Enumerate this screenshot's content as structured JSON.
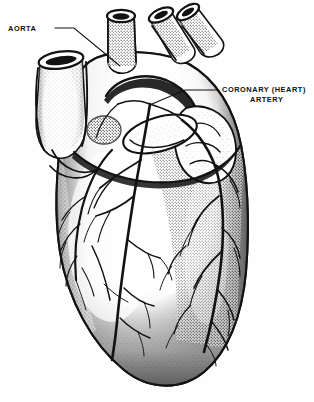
{
  "figure": {
    "style": "stippled pen-and-ink medical illustration",
    "background_color": "#fefefe",
    "ink_color": "#121212",
    "width": 314,
    "height": 402
  },
  "labels": [
    {
      "id": "aorta",
      "name": "aorta-label",
      "lines": [
        "AORTA"
      ],
      "text_x": 8,
      "text_y": 31,
      "anchor": "start",
      "leader": "M55,28 L74,28 L120,66",
      "leader_tip_x": 120,
      "leader_tip_y": 66
    },
    {
      "id": "coronary_artery",
      "name": "coronary-artery-label",
      "lines": [
        "CORONARY (HEART)",
        "ARTERY"
      ],
      "text_x": 222,
      "text_y": 92,
      "line2_x": 250,
      "line2_y": 102,
      "anchor": "start",
      "leader": "M218,90 L185,90 L152,104",
      "leader_tip_x": 152,
      "leader_tip_y": 104
    }
  ],
  "anatomy": {
    "great_vessels": [
      {
        "name": "aortic-arch-stump",
        "x": 120,
        "y": 12,
        "orientation": "vertical"
      },
      {
        "name": "pulmonary-trunk-stump",
        "x": 162,
        "y": 10,
        "orientation": "angled-right"
      },
      {
        "name": "superior-vessel-stump",
        "x": 188,
        "y": 8,
        "orientation": "angled-right"
      },
      {
        "name": "superior-vena-cava-stump",
        "x": 58,
        "y": 62,
        "orientation": "vertical-left"
      }
    ],
    "chambers": [
      {
        "name": "right-atrium-appendage",
        "x": 195,
        "y": 135
      },
      {
        "name": "right-ventricle",
        "x": 185,
        "y": 260
      },
      {
        "name": "left-ventricle",
        "x": 95,
        "y": 250
      },
      {
        "name": "apex",
        "x": 150,
        "y": 372
      }
    ],
    "vessels_on_surface": [
      {
        "name": "left-coronary-artery",
        "x": 150,
        "y": 110
      },
      {
        "name": "circumflex-branch",
        "x": 100,
        "y": 170
      },
      {
        "name": "anterior-interventricular-branch",
        "x": 200,
        "y": 230
      },
      {
        "name": "right-coronary-artery",
        "x": 215,
        "y": 175
      }
    ]
  }
}
